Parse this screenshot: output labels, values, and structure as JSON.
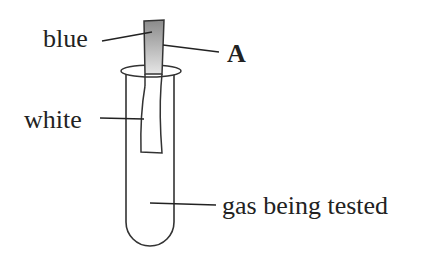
{
  "diagram": {
    "type": "litmus-paper-test-in-test-tube",
    "labels": {
      "blue": "blue",
      "a": "A",
      "white": "white",
      "gas": "gas being tested"
    },
    "colors": {
      "stroke": "#333333",
      "strip_top": "#8a8a8a",
      "strip_bottom": "#e8e8e8",
      "text": "#222222"
    }
  }
}
